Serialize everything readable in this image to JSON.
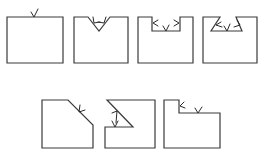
{
  "diagram": {
    "title": "",
    "colors": {
      "line": "#3a3a3a",
      "background": "#ffffff"
    },
    "figures": [
      {
        "id": "fig-1",
        "shape": "plain-block",
        "symbol_count": 1
      },
      {
        "id": "fig-2",
        "shape": "v-notch-block",
        "symbol_count": 2
      },
      {
        "id": "fig-3",
        "shape": "rectangular-slot-block",
        "symbol_count": 3
      },
      {
        "id": "fig-4",
        "shape": "dovetail-slot-block",
        "symbol_count": 3
      },
      {
        "id": "fig-5",
        "shape": "chamfered-corner-block",
        "symbol_count": 1
      },
      {
        "id": "fig-6",
        "shape": "angled-step-block",
        "symbol_count": 2
      },
      {
        "id": "fig-7",
        "shape": "stepped-block",
        "symbol_count": 2
      }
    ]
  }
}
